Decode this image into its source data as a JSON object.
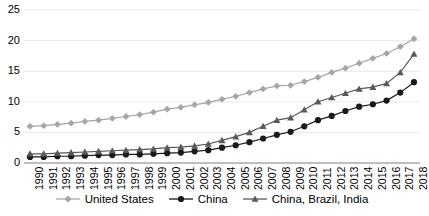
{
  "chart_data": {
    "type": "line",
    "title": "",
    "xlabel": "",
    "ylabel": "",
    "ylim": [
      0,
      25
    ],
    "yticks": [
      0,
      5,
      10,
      15,
      20,
      25
    ],
    "grid": true,
    "legend_position": "bottom",
    "x": [
      1990,
      1991,
      1992,
      1993,
      1994,
      1995,
      1996,
      1997,
      1998,
      1999,
      2000,
      2001,
      2002,
      2003,
      2004,
      2005,
      2006,
      2007,
      2008,
      2009,
      2010,
      2011,
      2012,
      2013,
      2014,
      2015,
      2016,
      2017,
      2018
    ],
    "categories": [
      "1990",
      "1991",
      "1992",
      "1993",
      "1994",
      "1995",
      "1996",
      "1997",
      "1998",
      "1999",
      "2000",
      "2001",
      "2002",
      "2003",
      "2004",
      "2005",
      "2006",
      "2007",
      "2008",
      "2009",
      "2010",
      "2011",
      "2012",
      "2013",
      "2014",
      "2015",
      "2016",
      "2017",
      "2018"
    ],
    "series": [
      {
        "name": "United States",
        "marker": "diamond",
        "color": "#a6a6a6",
        "values": [
          6.0,
          6.1,
          6.3,
          6.5,
          6.8,
          7.0,
          7.3,
          7.6,
          7.9,
          8.3,
          8.8,
          9.1,
          9.5,
          9.9,
          10.4,
          10.9,
          11.5,
          12.1,
          12.6,
          12.7,
          13.3,
          14.0,
          14.8,
          15.5,
          16.3,
          17.1,
          17.9,
          19.0,
          20.3
        ]
      },
      {
        "name": "China",
        "marker": "circle",
        "color": "#1a1a1a",
        "values": [
          1.0,
          1.0,
          1.1,
          1.1,
          1.2,
          1.3,
          1.3,
          1.4,
          1.4,
          1.5,
          1.6,
          1.7,
          1.9,
          2.1,
          2.5,
          2.9,
          3.4,
          4.0,
          4.6,
          5.1,
          6.0,
          7.0,
          7.7,
          8.5,
          9.2,
          9.6,
          10.2,
          11.5,
          13.2
        ]
      },
      {
        "name": "China, Brazil, India",
        "marker": "triangle",
        "color": "#595959",
        "values": [
          1.5,
          1.5,
          1.6,
          1.7,
          1.8,
          1.9,
          2.0,
          2.1,
          2.2,
          2.3,
          2.5,
          2.6,
          2.8,
          3.1,
          3.7,
          4.3,
          5.0,
          6.0,
          7.0,
          7.4,
          8.7,
          10.0,
          10.7,
          11.4,
          12.1,
          12.4,
          13.0,
          14.8,
          17.8
        ]
      }
    ]
  },
  "legend": {
    "items": [
      {
        "label": "United States"
      },
      {
        "label": "China"
      },
      {
        "label": "China, Brazil, India"
      }
    ]
  }
}
